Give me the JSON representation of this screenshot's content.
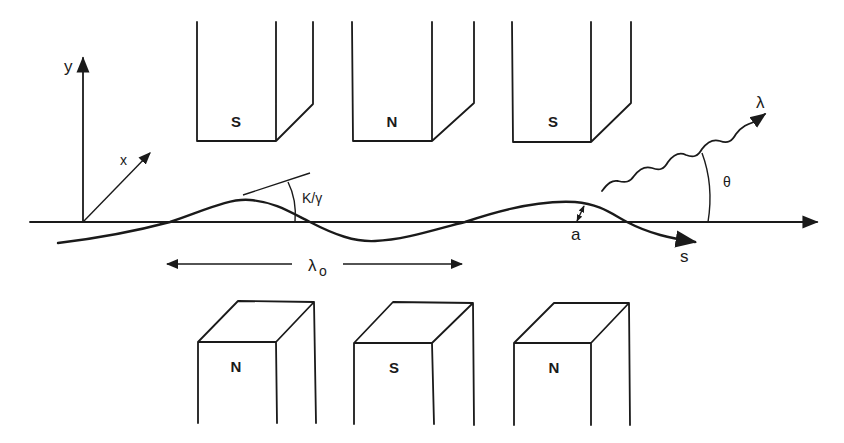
{
  "diagram": {
    "axes": {
      "x_label": "x",
      "y_label": "y",
      "s_label": "s"
    },
    "top_magnets": [
      {
        "pole": "S"
      },
      {
        "pole": "N"
      },
      {
        "pole": "S"
      }
    ],
    "bottom_magnets": [
      {
        "pole": "N"
      },
      {
        "pole": "S"
      },
      {
        "pole": "N"
      }
    ],
    "labels": {
      "deflection_angle": "K/γ",
      "period": "λ",
      "period_sub": "o",
      "amplitude": "a",
      "radiation_wavelength": "λ",
      "emission_angle": "θ"
    },
    "colors": {
      "ink": "#1a1a1a",
      "background": "#ffffff"
    }
  }
}
